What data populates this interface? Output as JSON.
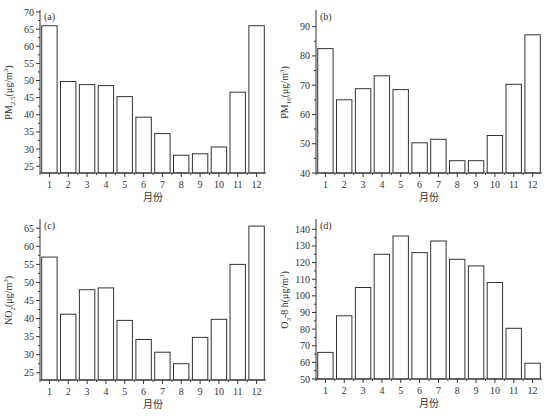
{
  "chart_data": [
    {
      "type": "bar",
      "panel": "(a)",
      "title": "",
      "xlabel": "月份",
      "ylabel": "PM2.5(μg/m³)",
      "ylabel_main": "PM",
      "ylabel_sub": "2.5",
      "ylabel_tail": "(μg/m",
      "categories": [
        "1",
        "2",
        "3",
        "4",
        "5",
        "6",
        "7",
        "8",
        "9",
        "10",
        "11",
        "12"
      ],
      "values": [
        66,
        49.7,
        48.8,
        48.5,
        45.3,
        39.3,
        34.5,
        28.2,
        28.6,
        30.6,
        46.6,
        66
      ],
      "ylim": [
        23,
        70
      ],
      "yticks": [
        25,
        30,
        35,
        40,
        45,
        50,
        55,
        60,
        65,
        70
      ],
      "grid": false
    },
    {
      "type": "bar",
      "panel": "(b)",
      "title": "",
      "xlabel": "月份",
      "ylabel": "PM10(μg/m³)",
      "ylabel_main": "PM",
      "ylabel_sub": "10",
      "ylabel_tail": "(μg/m",
      "categories": [
        "1",
        "2",
        "3",
        "4",
        "5",
        "6",
        "7",
        "8",
        "9",
        "10",
        "11",
        "12"
      ],
      "values": [
        82.5,
        65,
        68.8,
        73.2,
        68.5,
        50.3,
        51.5,
        44.2,
        44.2,
        52.8,
        70.3,
        87.2
      ],
      "ylim": [
        40,
        95
      ],
      "yticks": [
        40,
        50,
        60,
        70,
        80,
        90
      ],
      "grid": false
    },
    {
      "type": "bar",
      "panel": "(c)",
      "title": "",
      "xlabel": "月份",
      "ylabel": "NO2(μg/m³)",
      "ylabel_main": "NO",
      "ylabel_sub": "2",
      "ylabel_tail": "(μg/m",
      "categories": [
        "1",
        "2",
        "3",
        "4",
        "5",
        "6",
        "7",
        "8",
        "9",
        "10",
        "11",
        "12"
      ],
      "values": [
        57,
        41.2,
        48,
        48.5,
        39.5,
        34.2,
        30.7,
        27.5,
        34.8,
        39.8,
        55,
        65.6
      ],
      "ylim": [
        23,
        67
      ],
      "yticks": [
        25,
        30,
        35,
        40,
        45,
        50,
        55,
        60,
        65
      ],
      "grid": false
    },
    {
      "type": "bar",
      "panel": "(d)",
      "title": "",
      "xlabel": "月份",
      "ylabel": "O3-8 h(μg/m³)",
      "ylabel_main": "O",
      "ylabel_sub": "3",
      "ylabel_tail": "-8 h(μg/m",
      "categories": [
        "1",
        "2",
        "3",
        "4",
        "5",
        "6",
        "7",
        "8",
        "9",
        "10",
        "11",
        "12"
      ],
      "values": [
        66,
        88,
        105,
        125,
        136,
        126,
        133,
        122,
        118,
        108,
        80.5,
        59.5
      ],
      "ylim": [
        50,
        145
      ],
      "yticks": [
        50,
        60,
        70,
        80,
        90,
        100,
        110,
        120,
        130,
        140
      ],
      "grid": false
    }
  ]
}
